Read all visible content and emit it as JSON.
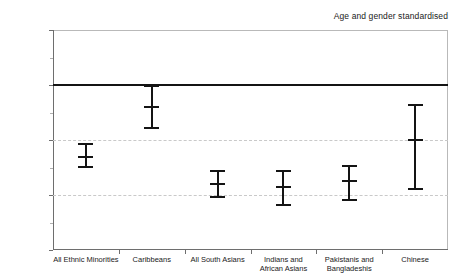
{
  "chart_data": {
    "type": "scatter",
    "title": "",
    "annotation": "Age and gender standardised",
    "xlabel": "",
    "ylabel": "",
    "ylim": [
      0.4,
      1.2
    ],
    "grid": true,
    "gridlines": [
      0.8,
      0.6
    ],
    "legend": "none",
    "reference_line": {
      "label": "Whites",
      "value": 1.0
    },
    "y_ticks": [
      {
        "value": 1.2,
        "label": "1.2"
      },
      {
        "value": 1.0,
        "label": "Whites"
      },
      {
        "value": 0.8,
        "label": "0.8"
      },
      {
        "value": 0.6,
        "label": "0.6"
      },
      {
        "value": 0.4,
        "label": "0.4"
      }
    ],
    "y_minor_ticks": [
      1.1,
      0.9,
      0.7,
      0.5
    ],
    "categories": [
      "All Ethnic Minorities",
      "Caribbeans",
      "All South Asians",
      "Indians and\nAfrican Asians",
      "Pakistanis and\nBangladeshis",
      "Chinese"
    ],
    "values": [
      0.74,
      0.92,
      0.64,
      0.63,
      0.65,
      0.8
    ],
    "ci_lower": [
      0.7,
      0.84,
      0.59,
      0.56,
      0.58,
      0.62
    ],
    "ci_upper": [
      0.79,
      1.0,
      0.69,
      0.69,
      0.71,
      0.93
    ],
    "points": [
      {
        "category": "All Ethnic Minorities",
        "value": 0.74,
        "low": 0.7,
        "high": 0.79
      },
      {
        "category": "Caribbeans",
        "value": 0.92,
        "low": 0.84,
        "high": 1.0
      },
      {
        "category": "All South Asians",
        "value": 0.64,
        "low": 0.59,
        "high": 0.69
      },
      {
        "category": "Indians and African Asians",
        "value": 0.63,
        "low": 0.56,
        "high": 0.69
      },
      {
        "category": "Pakistanis and Bangladeshis",
        "value": 0.65,
        "low": 0.58,
        "high": 0.71
      },
      {
        "category": "Chinese",
        "value": 0.8,
        "low": 0.62,
        "high": 0.93
      }
    ],
    "colors": {
      "marker": "#141414",
      "reference_line": "#141414",
      "gridline": "#c9c9c9",
      "axis": "#6e6e6e",
      "frame": "#b9b9b9",
      "text": "#1a1a1a",
      "background": "#ffffff"
    }
  }
}
